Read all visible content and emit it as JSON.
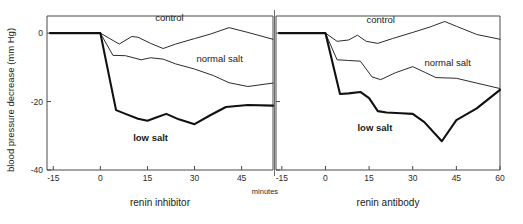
{
  "chart_data": {
    "type": "line",
    "title": "",
    "xlabel": "minutes",
    "ylabel": "blood pressure decrease (mm Hg)",
    "ylim": [
      -40,
      5
    ],
    "yticks": [
      0,
      -20,
      -40
    ],
    "ytick_labels": [
      "0",
      "-20",
      "-40"
    ],
    "grid": false,
    "legend_position": "inline-annotations",
    "panels": [
      {
        "name": "renin-inhibitor",
        "title": "renin inhibitor",
        "xlim": [
          -17,
          55
        ],
        "xticks": [
          -15,
          0,
          15,
          30,
          45
        ],
        "xtick_labels": [
          "-15",
          "0",
          "15",
          "30",
          "45"
        ],
        "series": [
          {
            "name": "control",
            "label": "control",
            "style": "thin",
            "label_x": 22,
            "label_y": 3.5,
            "x": [
              -16,
              0,
              3,
              6,
              10,
              12,
              16,
              20,
              24,
              30,
              35,
              41,
              47,
              55
            ],
            "y": [
              0,
              0,
              -1.6,
              -3.2,
              -1.0,
              -1.2,
              -3.0,
              -4.5,
              -3.2,
              -1.6,
              -0.3,
              1.6,
              0.2,
              -1.8
            ]
          },
          {
            "name": "normal-salt",
            "label": "normal salt",
            "style": "thin",
            "label_x": 38,
            "label_y": -8.5,
            "x": [
              -16,
              0,
              4,
              8,
              13,
              16,
              20,
              24,
              30,
              36,
              41,
              47,
              55
            ],
            "y": [
              0,
              0,
              -6.5,
              -6.6,
              -7.8,
              -7.2,
              -7.6,
              -9.0,
              -10.5,
              -12.4,
              -14.5,
              -15.6,
              -14.6
            ]
          },
          {
            "name": "low-salt",
            "label": "low salt",
            "style": "bold",
            "label_x": 16,
            "label_y": -31.5,
            "x": [
              -16,
              0,
              5,
              8,
              12,
              15,
              18,
              21,
              25,
              30,
              35,
              40,
              47,
              55
            ],
            "y": [
              0,
              0,
              -22.5,
              -23.6,
              -25.0,
              -25.6,
              -24.6,
              -23.6,
              -25.2,
              -26.6,
              -24.0,
              -21.6,
              -21.0,
              -21.2
            ]
          }
        ]
      },
      {
        "name": "renin-antibody",
        "title": "renin antibody",
        "xlim": [
          -17,
          60
        ],
        "xticks": [
          -15,
          0,
          15,
          30,
          45,
          60
        ],
        "xtick_labels": [
          "-15",
          "0",
          "15",
          "30",
          "45",
          "60"
        ],
        "series": [
          {
            "name": "control",
            "label": "control",
            "style": "thin",
            "label_x": 19,
            "label_y": 3.0,
            "x": [
              -16,
              0,
              4,
              8,
              11,
              14,
              18,
              23,
              30,
              36,
              41,
              45,
              52,
              60
            ],
            "y": [
              0,
              0,
              -2.4,
              -2.0,
              -0.6,
              -2.4,
              -3.0,
              -1.6,
              0.2,
              1.8,
              3.4,
              2.0,
              -0.4,
              -1.8
            ]
          },
          {
            "name": "normal-salt",
            "label": "normal salt",
            "style": "thin",
            "label_x": 42,
            "label_y": -9.5,
            "x": [
              -16,
              0,
              4,
              8,
              12,
              16,
              19,
              24,
              30,
              34,
              38,
              45,
              52,
              60
            ],
            "y": [
              0,
              0,
              -7.8,
              -8.0,
              -8.2,
              -12.8,
              -13.6,
              -11.6,
              -9.8,
              -11.4,
              -13.0,
              -13.2,
              -14.6,
              -16.2
            ]
          },
          {
            "name": "low-salt",
            "label": "low salt",
            "style": "bold",
            "label_x": 17,
            "label_y": -28.5,
            "x": [
              -16,
              0,
              5,
              8,
              12,
              15,
              18,
              21,
              26,
              30,
              34,
              40,
              45,
              52,
              60
            ],
            "y": [
              0,
              0,
              -17.8,
              -17.6,
              -17.2,
              -19.0,
              -22.8,
              -23.2,
              -23.4,
              -23.6,
              -26.0,
              -31.6,
              -25.4,
              -22.0,
              -16.6
            ]
          }
        ]
      }
    ]
  }
}
